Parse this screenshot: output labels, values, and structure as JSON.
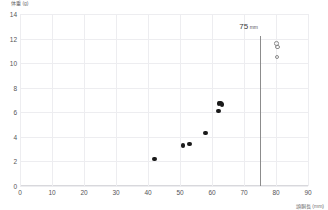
{
  "chart_data": {
    "type": "scatter",
    "title": "",
    "xlabel": "頭胴長 (mm)",
    "ylabel": "体重 (g)",
    "xlim": [
      0,
      90
    ],
    "ylim": [
      0,
      14
    ],
    "xticks": [
      0,
      10,
      20,
      30,
      40,
      50,
      60,
      70,
      80,
      90
    ],
    "yticks": [
      0,
      2,
      4,
      6,
      8,
      10,
      12,
      14
    ],
    "grid": true,
    "legend": "none",
    "series": [
      {
        "name": "measured",
        "marker": "filled-circle",
        "color": "#1a1a1a",
        "points": [
          {
            "x": 42.0,
            "y": 2.2
          },
          {
            "x": 51.0,
            "y": 3.3
          },
          {
            "x": 53.0,
            "y": 3.4
          },
          {
            "x": 58.0,
            "y": 4.3
          },
          {
            "x": 62.0,
            "y": 6.1
          },
          {
            "x": 62.2,
            "y": 6.7
          },
          {
            "x": 62.6,
            "y": 6.75
          },
          {
            "x": 63.2,
            "y": 6.65
          }
        ]
      },
      {
        "name": "extrapolated",
        "marker": "open-circle",
        "color": "#8a8a8a",
        "points": [
          {
            "x": 80.2,
            "y": 11.6
          },
          {
            "x": 80.4,
            "y": 11.3
          },
          {
            "x": 80.3,
            "y": 10.5
          }
        ]
      }
    ],
    "annotations": [
      {
        "type": "vline",
        "x": 75,
        "label": "75",
        "label_unit": "mm",
        "color": "#8c8c8c"
      }
    ]
  }
}
